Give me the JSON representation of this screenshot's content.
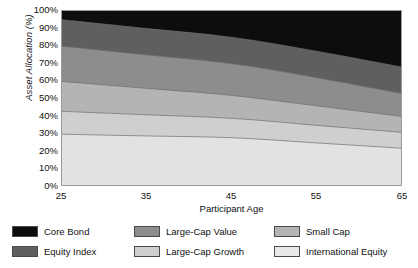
{
  "chart_data": {
    "type": "area",
    "title": "",
    "subtitle": "",
    "xlabel": "Participant Age",
    "ylabel": "Asset Allocation (%)",
    "x": [
      25,
      35,
      45,
      55,
      65
    ],
    "xlim": [
      25,
      65
    ],
    "ylim": [
      0,
      100
    ],
    "xticks": [
      "25",
      "35",
      "45",
      "55",
      "65"
    ],
    "yticks": [
      "0%",
      "10%",
      "20%",
      "30%",
      "40%",
      "50%",
      "60%",
      "70%",
      "80%",
      "90%",
      "100%"
    ],
    "grid": false,
    "stacked": true,
    "legend_position": "bottom",
    "legend_order": [
      "Core Bond",
      "Large-Cap Value",
      "Small Cap",
      "Equity Index",
      "Large-Cap Growth",
      "International Equity"
    ],
    "stack_order_bottom_to_top": [
      "International Equity",
      "Small Cap",
      "Large-Cap Growth",
      "Large-Cap Value",
      "Equity Index",
      "Core Bond"
    ],
    "series": [
      {
        "name": "International Equity",
        "color": "#e2e2e2",
        "values": [
          30,
          29,
          28,
          25,
          22
        ],
        "cumulative_top": [
          30,
          29,
          28,
          25,
          22
        ]
      },
      {
        "name": "Large-Cap Growth",
        "color": "#cfcfcf",
        "values": [
          13,
          12,
          11,
          10,
          9
        ],
        "cumulative_top": [
          43,
          41,
          39,
          35,
          31
        ]
      },
      {
        "name": "Small Cap",
        "color": "#b4b4b4",
        "values": [
          17,
          15,
          13,
          11,
          9
        ],
        "cumulative_top": [
          60,
          56,
          52,
          46,
          40
        ]
      },
      {
        "name": "Large-Cap Value",
        "color": "#8d8d8d",
        "values": [
          20,
          19,
          18,
          16,
          13
        ],
        "cumulative_top": [
          80,
          75,
          70,
          62,
          53
        ]
      },
      {
        "name": "Equity Index",
        "color": "#5f5f5f",
        "values": [
          15,
          15,
          15,
          15,
          15
        ],
        "cumulative_top": [
          95,
          90,
          85,
          77,
          68
        ]
      },
      {
        "name": "Core Bond",
        "color": "#0d0d0d",
        "values": [
          5,
          10,
          15,
          23,
          32
        ],
        "cumulative_top": [
          100,
          100,
          100,
          100,
          100
        ]
      }
    ]
  },
  "axes": {
    "y_title": "Asset Allocation (%)",
    "x_title": "Participant Age",
    "y_tick_labels": [
      "100%",
      "90%",
      "80%",
      "70%",
      "60%",
      "50%",
      "40%",
      "30%",
      "20%",
      "10%",
      "0%"
    ],
    "x_tick_labels": [
      "25",
      "35",
      "45",
      "55",
      "65"
    ]
  },
  "legend": {
    "items": [
      {
        "label": "Core Bond",
        "color": "#0d0d0d"
      },
      {
        "label": "Large-Cap Value",
        "color": "#8d8d8d"
      },
      {
        "label": "Small Cap",
        "color": "#b4b4b4"
      },
      {
        "label": "Equity Index",
        "color": "#5f5f5f"
      },
      {
        "label": "Large-Cap Growth",
        "color": "#cfcfcf"
      },
      {
        "label": "International Equity",
        "color": "#e9e9e9"
      }
    ]
  },
  "colors": {
    "core_bond": "#0d0d0d",
    "equity_index": "#5f5f5f",
    "large_cap_value": "#8d8d8d",
    "large_cap_growth": "#cfcfcf",
    "small_cap": "#b4b4b4",
    "international_equity": "#e2e2e2",
    "axis": "#9a9a9a",
    "text": "#111111",
    "background": "#ffffff"
  }
}
